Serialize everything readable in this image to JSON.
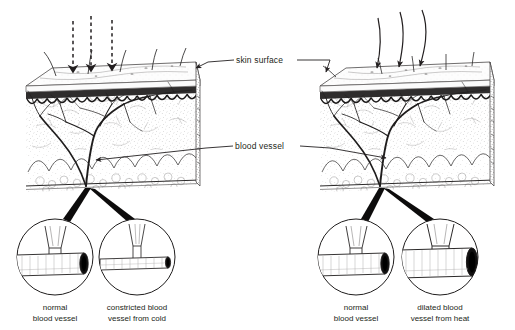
{
  "figure": {
    "type": "anatomical-diagram",
    "background_color": "#ffffff",
    "ink_color": "#231f20"
  },
  "labels": {
    "skin_surface": "skin surface",
    "blood_vessel": "blood vessel"
  },
  "panels": [
    {
      "id": "cold",
      "side": "left",
      "stimulus": "cold",
      "arrow_style": "dashed",
      "arrow_count": 3,
      "hair_state": "erect",
      "callouts": [
        {
          "id": "left-normal",
          "line1": "normal",
          "line2": "blood vessel",
          "vessel_state": "normal"
        },
        {
          "id": "left-constricted",
          "line1": "constricted blood",
          "line2": "vessel from cold",
          "vessel_state": "constricted"
        }
      ]
    },
    {
      "id": "heat",
      "side": "right",
      "stimulus": "heat",
      "arrow_style": "solid-curved",
      "arrow_count": 3,
      "hair_state": "flat",
      "callouts": [
        {
          "id": "right-normal",
          "line1": "normal",
          "line2": "blood vessel",
          "vessel_state": "normal"
        },
        {
          "id": "right-dilated",
          "line1": "dilated blood",
          "line2": "vessel from heat",
          "vessel_state": "dilated"
        }
      ]
    }
  ]
}
